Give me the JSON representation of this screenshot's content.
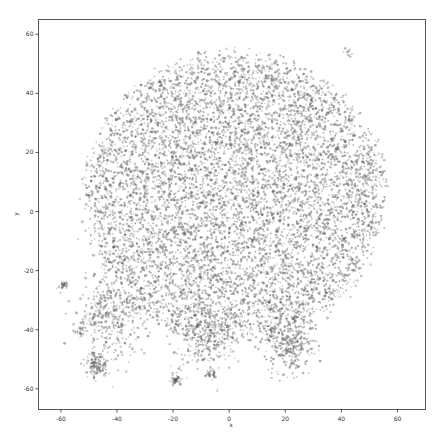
{
  "chart_data": {
    "type": "scatter",
    "title": "",
    "xlabel": "x",
    "ylabel": "y",
    "xlim": [
      -68,
      70
    ],
    "ylim": [
      -67,
      65
    ],
    "xticks": [
      -60,
      -40,
      -20,
      0,
      20,
      40,
      60
    ],
    "yticks": [
      -60,
      -40,
      -20,
      0,
      20,
      40,
      60
    ],
    "xtick_labels": [
      "-60",
      "-40",
      "-20",
      "0",
      "20",
      "40",
      "60"
    ],
    "ytick_labels": [
      "-60",
      "-40",
      "-20",
      "0",
      "20",
      "40",
      "60"
    ],
    "grid": false,
    "legend": null,
    "point_color": "#555555",
    "point_alpha": 0.45,
    "point_size": 1.2,
    "approx_point_count": 9000,
    "clusters": [
      {
        "name": "main-blob",
        "cx": 2,
        "cy": 5,
        "rx": 55,
        "ry": 50,
        "n": 7600
      },
      {
        "name": "lower-left",
        "cx": -42,
        "cy": -35,
        "rx": 10,
        "ry": 12,
        "n": 400
      },
      {
        "name": "bottom-center",
        "cx": -8,
        "cy": -42,
        "rx": 10,
        "ry": 10,
        "n": 300
      },
      {
        "name": "bottom-right",
        "cx": 21,
        "cy": -45,
        "rx": 7,
        "ry": 8,
        "n": 300
      },
      {
        "name": "bottom-left-small",
        "cx": -47,
        "cy": -52,
        "rx": 4,
        "ry": 4,
        "n": 120
      },
      {
        "name": "outlier-left",
        "cx": -59,
        "cy": -25,
        "rx": 1.5,
        "ry": 1.5,
        "n": 30
      },
      {
        "name": "outlier-left-2",
        "cx": -53,
        "cy": -40,
        "rx": 1.5,
        "ry": 1.5,
        "n": 20
      },
      {
        "name": "outlier-bottom",
        "cx": -19,
        "cy": -57,
        "rx": 2,
        "ry": 1.5,
        "n": 40
      },
      {
        "name": "outlier-bottom-2",
        "cx": -7,
        "cy": -55,
        "rx": 1.5,
        "ry": 1.5,
        "n": 25
      },
      {
        "name": "outlier-top-right",
        "cx": 42,
        "cy": 54,
        "rx": 1.5,
        "ry": 1.5,
        "n": 8
      }
    ]
  },
  "axes": {
    "frame_color": "#555555"
  }
}
